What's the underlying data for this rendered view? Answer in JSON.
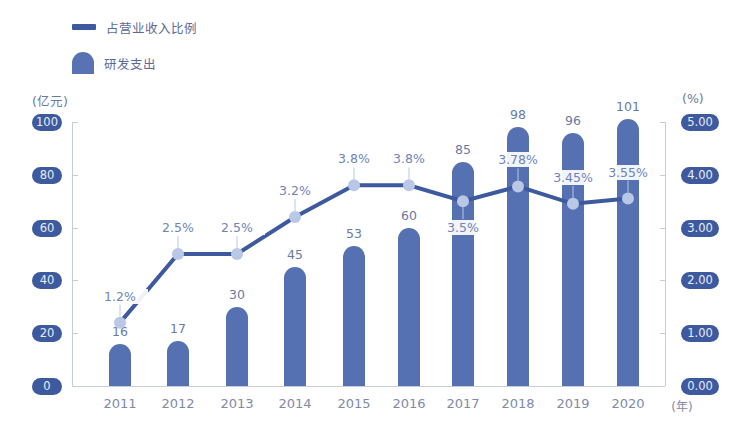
{
  "legend": {
    "line_label": "占营业收入比例",
    "bar_label": "研发支出"
  },
  "axes": {
    "left_unit": "(亿元)",
    "right_unit": "(%)",
    "x_unit": "(年)",
    "left_ticks": [
      "100",
      "80",
      "60",
      "40",
      "20",
      "0"
    ],
    "right_ticks": [
      "5.00",
      "4.00",
      "3.00",
      "2.00",
      "1.00",
      "0.00"
    ]
  },
  "years": [
    "2011",
    "2012",
    "2013",
    "2014",
    "2015",
    "2016",
    "2017",
    "2018",
    "2019",
    "2020"
  ],
  "bar_labels": [
    "16",
    "17",
    "30",
    "45",
    "53",
    "60",
    "85",
    "98",
    "96",
    "101"
  ],
  "pct_labels": [
    "1.2%",
    "2.5%",
    "2.5%",
    "3.2%",
    "3.8%",
    "3.8%",
    "3.5%",
    "3.78%",
    "3.45%",
    "3.55%"
  ],
  "colors": {
    "bar": "#5571b1",
    "line": "#3d5a9e",
    "marker": "#b9c8e6",
    "tick_badge": "#3d5a9e"
  },
  "chart_data": {
    "type": "bar",
    "title": "",
    "categories": [
      "2011",
      "2012",
      "2013",
      "2014",
      "2015",
      "2016",
      "2017",
      "2018",
      "2019",
      "2020"
    ],
    "series": [
      {
        "name": "研发支出",
        "type": "bar",
        "axis": "left",
        "unit": "亿元",
        "values": [
          16,
          17,
          30,
          45,
          53,
          60,
          85,
          98,
          96,
          101
        ]
      },
      {
        "name": "占营业收入比例",
        "type": "line",
        "axis": "right",
        "unit": "%",
        "values": [
          1.2,
          2.5,
          2.5,
          3.2,
          3.8,
          3.8,
          3.5,
          3.78,
          3.45,
          3.55
        ]
      }
    ],
    "xlabel": "(年)",
    "ylabel": "(亿元)",
    "y2label": "(%)",
    "ylim": [
      0,
      100
    ],
    "y2lim": [
      0,
      5
    ],
    "yticks": [
      0,
      20,
      40,
      60,
      80,
      100
    ],
    "y2ticks": [
      0.0,
      1.0,
      2.0,
      3.0,
      4.0,
      5.0
    ],
    "grid": false,
    "legend_position": "top-left"
  }
}
